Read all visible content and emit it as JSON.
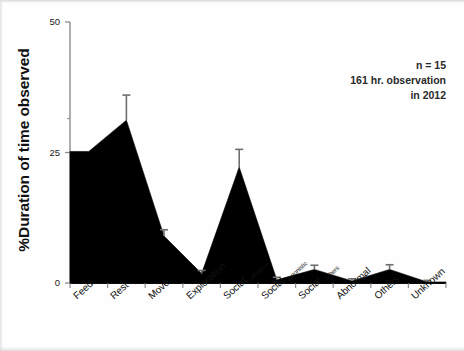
{
  "chart_data": {
    "type": "area",
    "title": "",
    "xlabel": "",
    "ylabel": "%Duration of time observed",
    "ylim": [
      0,
      50
    ],
    "yticks": [
      0,
      25,
      50
    ],
    "ytick_labels": [
      "0",
      "25",
      "50"
    ],
    "grid": false,
    "legend": null,
    "categories": [
      "Feed",
      "Rest",
      "Move",
      "Exploration",
      "Social_affiliative",
      "Social_agonistic",
      "Social_others",
      "Abnormal",
      "Others",
      "Unknown"
    ],
    "category_parts": [
      {
        "base": "Feed",
        "sub": ""
      },
      {
        "base": "Rest",
        "sub": ""
      },
      {
        "base": "Move",
        "sub": ""
      },
      {
        "base": "Exploration",
        "sub": ""
      },
      {
        "base": "Social_",
        "sub": "affiliative"
      },
      {
        "base": "Social_",
        "sub": "agonistic"
      },
      {
        "base": "Social_",
        "sub": "others"
      },
      {
        "base": "Abnormal",
        "sub": ""
      },
      {
        "base": "Others",
        "sub": ""
      },
      {
        "base": "Unknown",
        "sub": ""
      }
    ],
    "values": [
      25.2,
      31.2,
      9.0,
      1.8,
      22.2,
      0.6,
      2.6,
      0.4,
      2.6,
      0.2
    ],
    "errors": [
      0.0,
      4.8,
      1.2,
      0.6,
      3.4,
      0.5,
      0.8,
      0.4,
      0.9,
      0.3
    ],
    "series": [
      {
        "name": "%Duration of time observed",
        "values": [
          25.2,
          31.2,
          9.0,
          1.8,
          22.2,
          0.6,
          2.6,
          0.4,
          2.6,
          0.2
        ],
        "fill_color": "#000000"
      }
    ],
    "annotations": [
      "n = 15",
      "161 hr. observation",
      "in 2012"
    ]
  },
  "colors": {
    "fill": "#000000",
    "axis": "#8c8c8c",
    "axis_bottom": "#111111",
    "text": "#111111",
    "annotation": "#2a2a2a",
    "errorbar": "#6f6f6f"
  }
}
